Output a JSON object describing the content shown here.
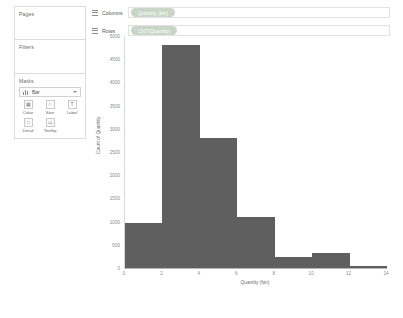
{
  "left_panel": {
    "pages": {
      "title": "Pages"
    },
    "filters": {
      "title": "Filters"
    },
    "marks": {
      "title": "Marks",
      "mark_type": "Bar",
      "mark_type_icon": "bar-chart-icon",
      "caret_icon": "chevron-down-icon",
      "buttons": [
        {
          "label": "Color",
          "icon": "color-icon",
          "glyph": "▦"
        },
        {
          "label": "Size",
          "icon": "size-icon",
          "glyph": "○"
        },
        {
          "label": "Label",
          "icon": "label-icon",
          "glyph": "T"
        },
        {
          "label": "Detail",
          "icon": "detail-icon",
          "glyph": "∷"
        },
        {
          "label": "Tooltip",
          "icon": "tooltip-icon",
          "glyph": "▭"
        }
      ]
    }
  },
  "shelves": [
    {
      "label": "Columns",
      "icon": "columns-icon",
      "pill": "Quantity (bin)"
    },
    {
      "label": "Rows",
      "icon": "rows-icon",
      "pill": "CNT(Quantity)"
    }
  ],
  "colors": {
    "bar": "#5f5f5f",
    "pill": "#c9d6c7",
    "axis": "#b6b6b6",
    "tick_text": "#8a8a8a"
  },
  "chart_data": {
    "type": "bar",
    "title": "",
    "xlabel": "Quantity (bin)",
    "ylabel": "Count of Quantity",
    "categories": [
      0,
      2,
      4,
      6,
      8,
      10,
      12
    ],
    "values": [
      980,
      4800,
      2800,
      1100,
      230,
      330,
      40
    ],
    "bin_size": 2,
    "xlim": [
      0,
      14
    ],
    "ylim": [
      0,
      5000
    ],
    "xticks": [
      0,
      2,
      4,
      6,
      8,
      10,
      12,
      14
    ],
    "yticks": [
      0,
      500,
      1000,
      1500,
      2000,
      2500,
      3000,
      3500,
      4000,
      4500,
      5000
    ],
    "grid": false,
    "legend": "none"
  }
}
